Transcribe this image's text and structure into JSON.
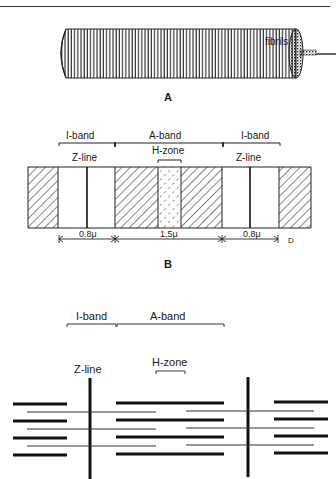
{
  "figure": {
    "part_a": {
      "label": "A",
      "fibrils_label": "fibrils"
    },
    "part_b": {
      "label": "B",
      "bands": [
        {
          "name": "I-band"
        },
        {
          "name": "A-band"
        },
        {
          "name": "I-band"
        }
      ],
      "z_line_left": "Z-line",
      "z_line_right": "Z-line",
      "h_zone": "H-zone",
      "dimensions": [
        "0.8μ",
        "1.5μ",
        "0.8μ"
      ],
      "end_marker": "D"
    },
    "part_c": {
      "i_band": "I-band",
      "a_band": "A-band",
      "z_line": "Z-line",
      "h_zone": "H-zone"
    },
    "colors": {
      "ink": "#1a1a1a",
      "background": "#ffffff"
    }
  }
}
